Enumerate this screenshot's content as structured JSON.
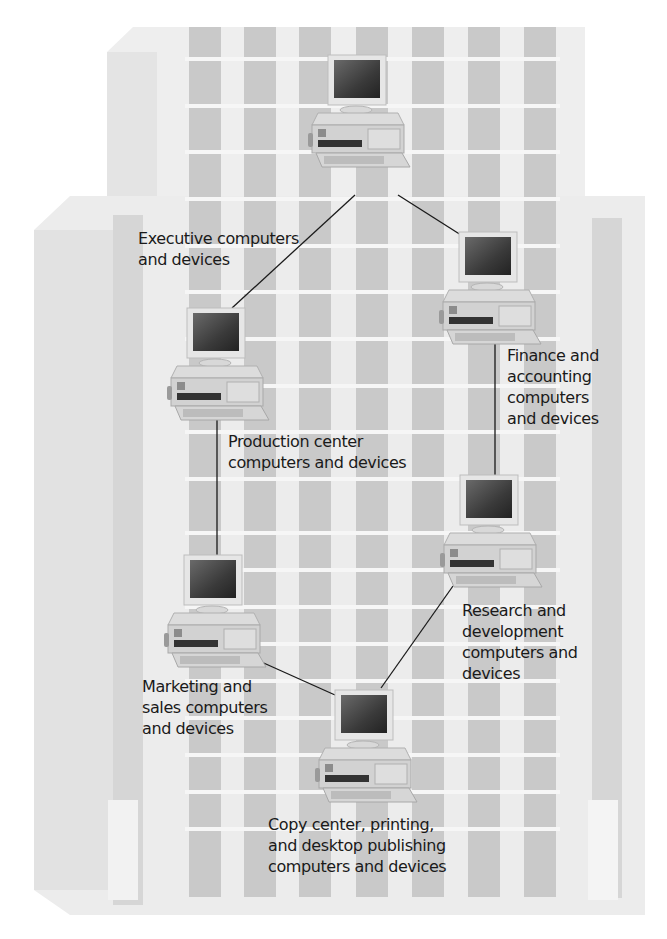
{
  "diagram": {
    "type": "network-topology",
    "topology": "ring",
    "background": "office building",
    "colors": {
      "building_face": "#ededed",
      "building_side": "#e3e3e3",
      "window": "#c9c9c9",
      "column_dark": "#d4d4d4",
      "link_line": "#1a1a1a",
      "text": "#1a1a1a"
    },
    "nodes": [
      {
        "id": "executive",
        "label": "Executive computers\nand devices"
      },
      {
        "id": "finance",
        "label": "Finance and\naccounting\ncomputers\nand devices"
      },
      {
        "id": "production",
        "label": "Production center\ncomputers and devices"
      },
      {
        "id": "research",
        "label": "Research and\ndevelopment\ncomputers and\ndevices"
      },
      {
        "id": "marketing",
        "label": "Marketing and\nsales computers\nand devices"
      },
      {
        "id": "copy",
        "label": "Copy center, printing,\nand desktop publishing\ncomputers and devices"
      }
    ],
    "links": [
      [
        "executive",
        "production"
      ],
      [
        "executive",
        "finance"
      ],
      [
        "finance",
        "research"
      ],
      [
        "production",
        "marketing"
      ],
      [
        "marketing",
        "copy"
      ],
      [
        "research",
        "copy"
      ]
    ]
  }
}
